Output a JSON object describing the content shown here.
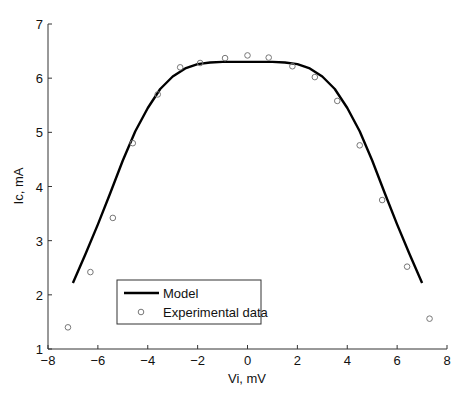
{
  "chart_data": {
    "type": "line",
    "title": "",
    "xlabel": "Vi, mV",
    "ylabel": "Ic, mA",
    "xlim": [
      -8,
      8
    ],
    "ylim": [
      1,
      7
    ],
    "xticks": [
      -8,
      -6,
      -4,
      -2,
      0,
      2,
      4,
      6,
      8
    ],
    "yticks": [
      1,
      2,
      3,
      4,
      5,
      6,
      7
    ],
    "grid": false,
    "legend_position": "lower left",
    "series": [
      {
        "name": "Model",
        "style": "line",
        "x": [
          -7.0,
          -6.5,
          -6.0,
          -5.5,
          -5.0,
          -4.5,
          -4.0,
          -3.5,
          -3.0,
          -2.5,
          -2.0,
          -1.5,
          -1.0,
          0,
          1.0,
          1.5,
          2.0,
          2.5,
          3.0,
          3.5,
          4.0,
          4.5,
          5.0,
          5.5,
          6.0,
          6.5,
          7.0
        ],
        "y": [
          2.22,
          2.75,
          3.3,
          3.88,
          4.48,
          5.02,
          5.45,
          5.8,
          6.03,
          6.18,
          6.26,
          6.29,
          6.3,
          6.3,
          6.3,
          6.29,
          6.26,
          6.18,
          6.03,
          5.8,
          5.45,
          5.02,
          4.48,
          3.88,
          3.3,
          2.75,
          2.22
        ]
      },
      {
        "name": "Experimental data",
        "style": "marker-circle",
        "x": [
          -7.2,
          -6.3,
          -5.4,
          -4.6,
          -3.6,
          -2.7,
          -1.9,
          -0.9,
          0.0,
          0.85,
          1.8,
          2.7,
          3.6,
          4.5,
          5.4,
          6.4,
          7.3
        ],
        "y": [
          1.4,
          2.42,
          3.42,
          4.8,
          5.7,
          6.2,
          6.28,
          6.37,
          6.42,
          6.38,
          6.22,
          6.02,
          5.58,
          4.76,
          3.75,
          2.52,
          1.56
        ]
      }
    ]
  },
  "legend": {
    "model_label": "Model",
    "experimental_label": "Experimental data"
  }
}
